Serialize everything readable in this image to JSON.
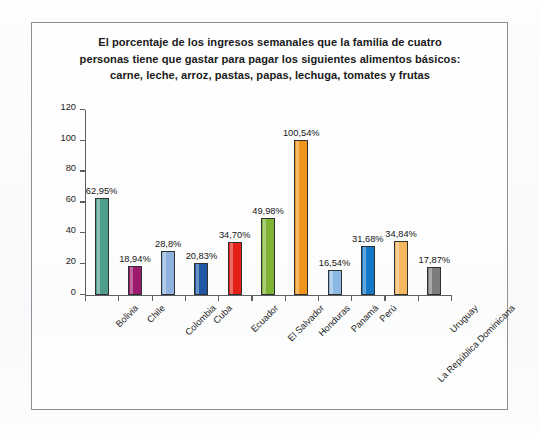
{
  "chart_data": {
    "type": "bar",
    "title_lines": [
      "El porcentaje de los ingresos semanales que la familia de cuatro",
      "personas tiene que gastar para pagar los siguientes alimentos básicos:",
      "carne, leche, arroz, pastas, papas, lechuga, tomates y frutas"
    ],
    "xlabel": "",
    "ylabel": "",
    "ylim": [
      0,
      120
    ],
    "yticks": [
      0,
      20,
      40,
      60,
      80,
      100,
      120
    ],
    "ytick_labels": [
      "0",
      "20",
      "40",
      "60",
      "80",
      "100",
      "120"
    ],
    "grid": false,
    "legend": "none",
    "categories": [
      "Bolivia",
      "Chile",
      "Colombia",
      "Cuba",
      "Ecuador",
      "El Salvador",
      "Honduras",
      "Panamá",
      "Perú",
      "La República Dominicana",
      "Uruguay"
    ],
    "values": [
      62.95,
      18.94,
      28.8,
      20.83,
      34.7,
      49.98,
      100.54,
      16.54,
      31.68,
      34.84,
      17.87
    ],
    "value_labels": [
      "62,95%",
      "18,94%",
      "28,8%",
      "20,83%",
      "34,70%",
      "49,98%",
      "100,54%",
      "16,54%",
      "31,68%",
      "34,84%",
      "17,87%"
    ],
    "colors": [
      "#4f9e8d",
      "#9c1a6e",
      "#8db2dd",
      "#1f57a4",
      "#e32119",
      "#7fb333",
      "#f0951c",
      "#8cb9e4",
      "#1478c8",
      "#f5b760",
      "#7d7d7d"
    ],
    "bar_outline_color": "#303030"
  }
}
